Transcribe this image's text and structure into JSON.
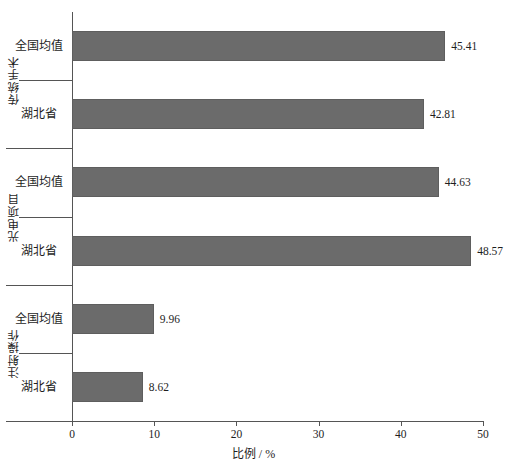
{
  "chart_data": {
    "type": "bar",
    "orientation": "horizontal",
    "title": "",
    "xlabel": "比例 / %",
    "ylabel": "",
    "xlim": [
      0,
      50
    ],
    "xticks": [
      0,
      10,
      20,
      30,
      40,
      50
    ],
    "grid": false,
    "legend": false,
    "bar_color": "#6b6b6b",
    "groups": [
      {
        "name": "传统手术",
        "categories": [
          "全国均值",
          "湖北省"
        ],
        "values": [
          45.41,
          42.81
        ]
      },
      {
        "name": "光电项目",
        "categories": [
          "全国均值",
          "湖北省"
        ],
        "values": [
          44.63,
          48.57
        ]
      },
      {
        "name": "注射操作",
        "categories": [
          "全国均值",
          "湖北省"
        ],
        "values": [
          9.96,
          8.62
        ]
      }
    ],
    "bars": [
      {
        "group": "传统手术",
        "category": "全国均值",
        "value": 45.41,
        "label": "45.41"
      },
      {
        "group": "传统手术",
        "category": "湖北省",
        "value": 42.81,
        "label": "42.81"
      },
      {
        "group": "光电项目",
        "category": "全国均值",
        "value": 44.63,
        "label": "44.63"
      },
      {
        "group": "光电项目",
        "category": "湖北省",
        "value": 48.57,
        "label": "48.57"
      },
      {
        "group": "注射操作",
        "category": "全国均值",
        "value": 9.96,
        "label": "9.96"
      },
      {
        "group": "注射操作",
        "category": "湖北省",
        "value": 8.62,
        "label": "8.62"
      }
    ],
    "xtick_labels": [
      "0",
      "10",
      "20",
      "30",
      "40",
      "50"
    ]
  }
}
